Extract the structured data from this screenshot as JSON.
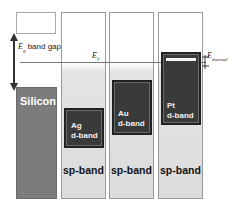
{
  "diagram": {
    "title": "",
    "band_gap_label": {
      "symbol": "E",
      "subscript": "g",
      "text": "band gap"
    },
    "fermi_label": {
      "symbol": "E",
      "subscript": "F"
    },
    "thermal_label": {
      "symbol": "E",
      "subscript": "thermal"
    },
    "columns": [
      {
        "name": "Silicon",
        "label": "Silicon"
      },
      {
        "name": "Ag",
        "d_band_label_line1": "Ag",
        "d_band_label_line2": "d-band",
        "sp_band_label": "sp-band"
      },
      {
        "name": "Au",
        "d_band_label_line1": "Au",
        "d_band_label_line2": "d-band",
        "sp_band_label": "sp-band"
      },
      {
        "name": "Pt",
        "d_band_label_line1": "Pt",
        "d_band_label_line2": "d-band",
        "sp_band_label": "sp-band"
      }
    ],
    "colors": {
      "silicon": "#7c7c7c",
      "d_band": "#3a3a3a",
      "sp_band": "#dcdcdc"
    }
  }
}
